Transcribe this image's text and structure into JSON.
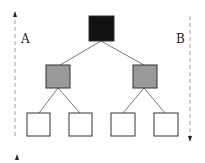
{
  "labels": {
    "left": "A",
    "right": "B"
  },
  "colors": {
    "root": "#111111",
    "mid": "#999999",
    "leaf": "#ffffff",
    "stroke": "#333333",
    "dash": "#888888"
  },
  "tree": {
    "root": {
      "fill": "black"
    },
    "level2": [
      {
        "fill": "gray"
      },
      {
        "fill": "gray"
      }
    ],
    "leaves": [
      {
        "fill": "white"
      },
      {
        "fill": "white"
      },
      {
        "fill": "white"
      },
      {
        "fill": "white"
      }
    ]
  },
  "arrows": {
    "left": "up",
    "right": "down"
  }
}
